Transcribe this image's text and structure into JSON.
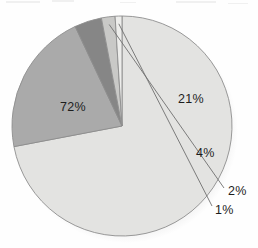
{
  "chart_data": {
    "type": "pie",
    "title": "",
    "subtitle": "",
    "xlabel": "",
    "ylabel": "",
    "legend_position": "none",
    "grid": false,
    "labels_format": "percent",
    "start_angle_deg": 0,
    "direction": "clockwise",
    "categories": [
      "72%",
      "21%",
      "4%",
      "2%",
      "1%"
    ],
    "values": [
      72,
      21,
      4,
      2,
      1
    ],
    "slices": [
      {
        "label": "72%",
        "value": 72,
        "color": "#e3e3e1",
        "label_placement": "inside",
        "leader_line": false
      },
      {
        "label": "21%",
        "value": 21,
        "color": "#aaaaaa",
        "label_placement": "inside",
        "leader_line": false
      },
      {
        "label": "4%",
        "value": 4,
        "color": "#868686",
        "label_placement": "inside",
        "leader_line": false
      },
      {
        "label": "2%",
        "value": 2,
        "color": "#c9c9c7",
        "label_placement": "outside",
        "leader_line": true
      },
      {
        "label": "1%",
        "value": 1,
        "color": "#ededeb",
        "label_placement": "outside",
        "leader_line": true
      }
    ],
    "geometry": {
      "center_x": 122,
      "center_y": 126,
      "radius": 110
    },
    "colors": {
      "outline": "#8d8d8d",
      "label_text": "#1d1d1d",
      "leader_line": "#6f6f6f",
      "background": "#fefefe",
      "shadow": "#cfcfcf"
    }
  }
}
